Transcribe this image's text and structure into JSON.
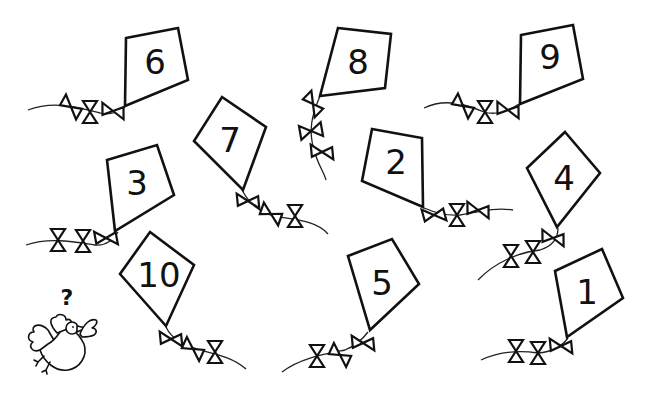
{
  "worksheet": {
    "background": "#ffffff",
    "ink": "#111111",
    "kites": [
      {
        "id": "kite-6",
        "number": "6"
      },
      {
        "id": "kite-8",
        "number": "8"
      },
      {
        "id": "kite-9",
        "number": "9"
      },
      {
        "id": "kite-7",
        "number": "7"
      },
      {
        "id": "kite-3",
        "number": "3"
      },
      {
        "id": "kite-2",
        "number": "2"
      },
      {
        "id": "kite-4",
        "number": "4"
      },
      {
        "id": "kite-10",
        "number": "10"
      },
      {
        "id": "kite-5",
        "number": "5"
      },
      {
        "id": "kite-1",
        "number": "1"
      }
    ],
    "bird": {
      "label": "?"
    }
  }
}
